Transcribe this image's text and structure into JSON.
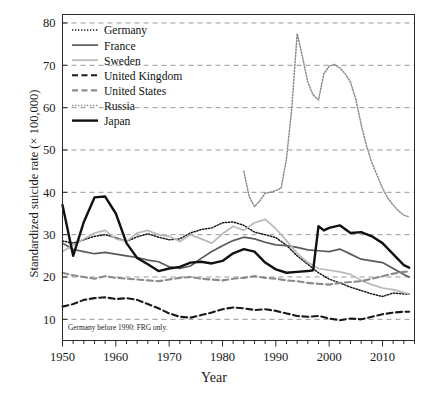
{
  "chart_data": {
    "type": "line",
    "title": "",
    "xlabel": "Year",
    "ylabel": "Standardized suicide rate (× 100,000)",
    "xlim": [
      1950,
      2016
    ],
    "ylim": [
      5,
      82
    ],
    "xticks": [
      1950,
      1960,
      1970,
      1980,
      1990,
      2000,
      2010
    ],
    "yticks": [
      10,
      20,
      30,
      40,
      50,
      60,
      70,
      80
    ],
    "grid": "horizontal-dashed",
    "legend_position": "top-left-inside",
    "annotation": "Germany before 1990: FRG only.",
    "series": [
      {
        "name": "Germany",
        "style": "fine-dotted",
        "color": "#1a1a1a",
        "x": [
          1950,
          1952,
          1954,
          1956,
          1958,
          1960,
          1962,
          1964,
          1966,
          1968,
          1970,
          1972,
          1974,
          1976,
          1978,
          1980,
          1982,
          1984,
          1986,
          1988,
          1990,
          1992,
          1994,
          1996,
          1998,
          2000,
          2002,
          2004,
          2006,
          2008,
          2010,
          2012,
          2014,
          2015
        ],
        "y": [
          28.5,
          28.0,
          28.8,
          29.6,
          30.0,
          29.3,
          28.4,
          29.5,
          30.2,
          29.4,
          28.8,
          29.0,
          30.4,
          31.2,
          31.6,
          32.8,
          33.0,
          32.2,
          30.6,
          30.0,
          29.3,
          27.5,
          25.0,
          23.0,
          21.0,
          19.5,
          18.6,
          17.6,
          16.8,
          16.0,
          15.4,
          16.2,
          16.0,
          15.9
        ]
      },
      {
        "name": "France",
        "style": "solid",
        "color": "#5a5a5a",
        "x": [
          1950,
          1952,
          1954,
          1956,
          1958,
          1960,
          1962,
          1964,
          1966,
          1968,
          1970,
          1972,
          1974,
          1976,
          1978,
          1980,
          1982,
          1984,
          1986,
          1988,
          1990,
          1992,
          1994,
          1996,
          1998,
          2000,
          2002,
          2004,
          2006,
          2008,
          2010,
          2012,
          2014,
          2015
        ],
        "y": [
          28.0,
          26.5,
          26.0,
          25.5,
          25.8,
          25.4,
          25.0,
          24.6,
          24.0,
          23.6,
          22.4,
          22.0,
          22.6,
          24.4,
          26.0,
          27.4,
          28.6,
          29.4,
          29.0,
          28.2,
          27.6,
          27.4,
          27.0,
          26.4,
          26.2,
          26.0,
          26.6,
          25.4,
          24.2,
          23.8,
          23.4,
          22.0,
          20.6,
          20.0
        ]
      },
      {
        "name": "Sweden",
        "style": "solid",
        "color": "#b9b9b9",
        "x": [
          1950,
          1952,
          1954,
          1956,
          1958,
          1960,
          1962,
          1964,
          1966,
          1968,
          1970,
          1972,
          1974,
          1976,
          1978,
          1980,
          1982,
          1984,
          1986,
          1988,
          1990,
          1992,
          1994,
          1996,
          1998,
          2000,
          2002,
          2004,
          2006,
          2008,
          2010,
          2012,
          2014,
          2015
        ],
        "y": [
          26.0,
          27.5,
          29.0,
          30.4,
          31.0,
          29.0,
          28.4,
          30.4,
          31.0,
          30.0,
          29.6,
          28.4,
          30.0,
          29.0,
          28.0,
          30.2,
          32.0,
          31.0,
          32.8,
          33.6,
          31.4,
          28.6,
          25.6,
          23.4,
          22.0,
          21.6,
          21.2,
          20.6,
          19.2,
          18.2,
          17.4,
          17.0,
          16.3,
          16.0
        ]
      },
      {
        "name": "United Kingdom",
        "style": "dashed",
        "color": "#1a1a1a",
        "x": [
          1950,
          1952,
          1954,
          1956,
          1958,
          1960,
          1962,
          1964,
          1966,
          1968,
          1970,
          1972,
          1974,
          1976,
          1978,
          1980,
          1982,
          1984,
          1986,
          1988,
          1990,
          1992,
          1994,
          1996,
          1998,
          2000,
          2002,
          2004,
          2006,
          2008,
          2010,
          2012,
          2014,
          2015
        ],
        "y": [
          13.0,
          13.6,
          14.6,
          15.0,
          15.2,
          14.8,
          15.0,
          14.6,
          13.6,
          12.6,
          11.4,
          10.6,
          10.4,
          11.0,
          11.6,
          12.4,
          12.8,
          12.6,
          12.2,
          12.4,
          12.0,
          11.4,
          10.8,
          10.6,
          10.8,
          10.2,
          9.8,
          10.2,
          10.0,
          10.6,
          11.2,
          11.6,
          11.8,
          11.8
        ]
      },
      {
        "name": "United States",
        "style": "dashed",
        "color": "#8a8a8a",
        "x": [
          1950,
          1952,
          1954,
          1956,
          1958,
          1960,
          1962,
          1964,
          1966,
          1968,
          1970,
          1972,
          1974,
          1976,
          1978,
          1980,
          1982,
          1984,
          1986,
          1988,
          1990,
          1992,
          1994,
          1996,
          1998,
          2000,
          2002,
          2004,
          2006,
          2008,
          2010,
          2012,
          2014,
          2015
        ],
        "y": [
          21.0,
          20.4,
          20.0,
          19.6,
          20.2,
          19.8,
          19.6,
          19.4,
          19.2,
          19.0,
          19.4,
          19.8,
          20.0,
          19.6,
          19.4,
          19.2,
          19.6,
          19.8,
          20.2,
          19.8,
          19.6,
          19.2,
          19.0,
          18.6,
          18.4,
          18.2,
          18.6,
          18.8,
          19.0,
          19.6,
          20.2,
          20.8,
          21.2,
          21.3
        ]
      },
      {
        "name": "Russia",
        "style": "fine-dotted",
        "color": "#8a8a8a",
        "x": [
          1984,
          1985,
          1986,
          1987,
          1988,
          1989,
          1990,
          1991,
          1992,
          1993,
          1994,
          1995,
          1996,
          1997,
          1998,
          1999,
          2000,
          2001,
          2002,
          2003,
          2004,
          2005,
          2006,
          2007,
          2008,
          2009,
          2010,
          2011,
          2012,
          2013,
          2014,
          2015
        ],
        "y": [
          45.0,
          39.0,
          36.6,
          38.0,
          39.8,
          40.0,
          40.4,
          41.0,
          48.0,
          60.0,
          77.5,
          72.0,
          66.0,
          63.0,
          61.8,
          68.0,
          69.8,
          70.2,
          69.4,
          68.0,
          66.0,
          62.0,
          56.0,
          51.0,
          47.0,
          44.0,
          41.0,
          38.6,
          37.0,
          35.6,
          34.6,
          34.2
        ]
      },
      {
        "name": "Japan",
        "style": "solid-thick",
        "color": "#111111",
        "x": [
          1950,
          1952,
          1954,
          1956,
          1958,
          1960,
          1962,
          1964,
          1966,
          1968,
          1970,
          1972,
          1974,
          1976,
          1978,
          1980,
          1982,
          1984,
          1986,
          1988,
          1990,
          1992,
          1994,
          1996,
          1997,
          1998,
          1999,
          2000,
          2002,
          2004,
          2006,
          2008,
          2010,
          2012,
          2014,
          2015
        ],
        "y": [
          37.0,
          25.0,
          33.0,
          38.8,
          39.0,
          35.0,
          28.0,
          24.5,
          23.0,
          21.4,
          22.0,
          22.4,
          23.4,
          23.6,
          23.2,
          23.8,
          25.6,
          26.6,
          26.0,
          23.4,
          21.8,
          21.0,
          21.2,
          21.4,
          21.6,
          32.0,
          31.0,
          31.6,
          32.2,
          30.4,
          30.6,
          29.6,
          28.0,
          25.4,
          22.8,
          22.2
        ]
      }
    ]
  },
  "legend": {
    "items": [
      {
        "label": "Germany"
      },
      {
        "label": "France"
      },
      {
        "label": "Sweden"
      },
      {
        "label": "United Kingdom"
      },
      {
        "label": "United States"
      },
      {
        "label": "Russia"
      },
      {
        "label": "Japan"
      }
    ]
  },
  "axis": {
    "y_tick_labels": [
      "80",
      "70",
      "60",
      "50",
      "40",
      "30",
      "20",
      "10"
    ],
    "x_tick_labels": [
      "1950",
      "1960",
      "1970",
      "1980",
      "1990",
      "2000",
      "2010"
    ]
  }
}
